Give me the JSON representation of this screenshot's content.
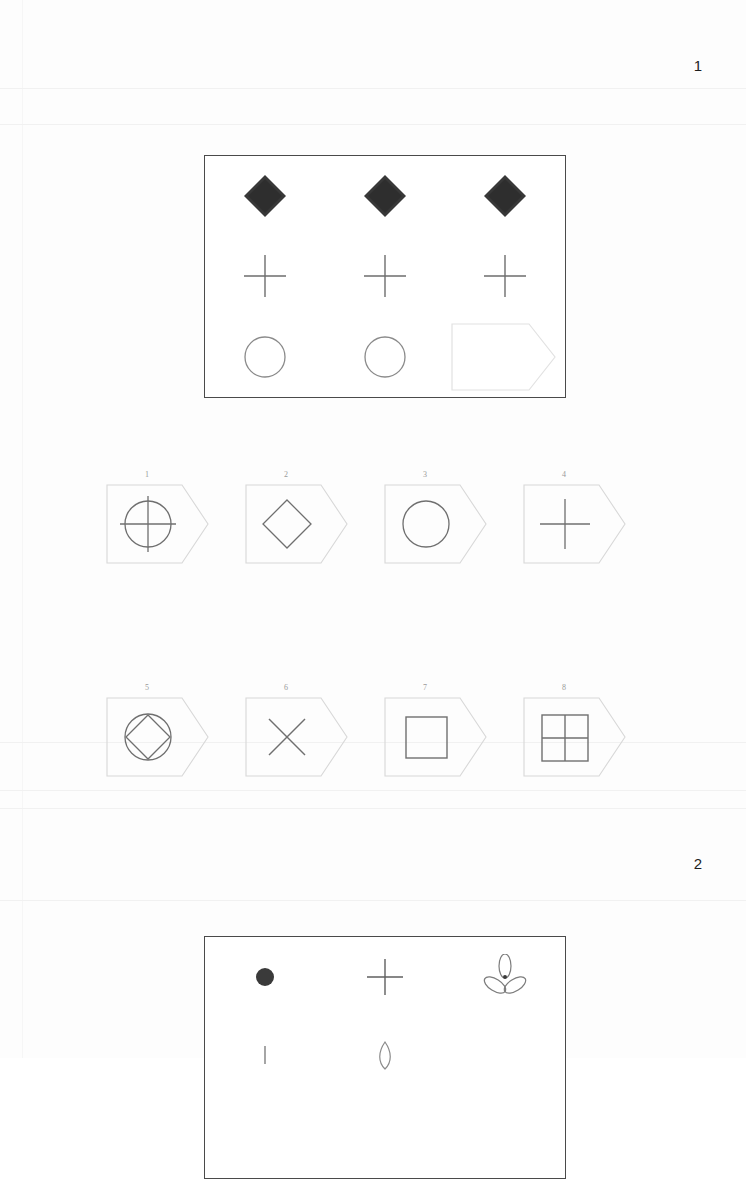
{
  "document": {
    "kind": "scanned-nonverbal-reasoning-test",
    "background_color": "#fdfdfd",
    "ink_color": "#4a4a4a"
  },
  "pages": [
    {
      "id": "page-1",
      "number": "1",
      "matrix": {
        "name": "matrix-problem-1",
        "rows": 3,
        "columns": 3,
        "cells": [
          {
            "row": 1,
            "col": 1,
            "shape": "filled-diamond",
            "state": "given",
            "fill": "#383838"
          },
          {
            "row": 1,
            "col": 2,
            "shape": "filled-diamond",
            "state": "given",
            "fill": "#383838"
          },
          {
            "row": 1,
            "col": 3,
            "shape": "filled-diamond",
            "state": "given",
            "fill": "#383838"
          },
          {
            "row": 2,
            "col": 1,
            "shape": "plus",
            "state": "given",
            "fill": "none"
          },
          {
            "row": 2,
            "col": 2,
            "shape": "plus",
            "state": "given",
            "fill": "none"
          },
          {
            "row": 2,
            "col": 3,
            "shape": "plus",
            "state": "given",
            "fill": "none"
          },
          {
            "row": 3,
            "col": 1,
            "shape": "circle-outline",
            "state": "given",
            "fill": "none"
          },
          {
            "row": 3,
            "col": 2,
            "shape": "circle-outline",
            "state": "given",
            "fill": "none"
          },
          {
            "row": 3,
            "col": 3,
            "shape": "tag-blank",
            "state": "missing",
            "fill": "none"
          }
        ]
      },
      "options": [
        {
          "number": "1",
          "shape": "circle-with-cross",
          "label": "1"
        },
        {
          "number": "2",
          "shape": "diamond-outline",
          "label": "2"
        },
        {
          "number": "3",
          "shape": "circle-outline",
          "label": "3"
        },
        {
          "number": "4",
          "shape": "plus",
          "label": "4"
        },
        {
          "number": "5",
          "shape": "circle-with-diamond",
          "label": "5"
        },
        {
          "number": "6",
          "shape": "x-cross",
          "label": "6"
        },
        {
          "number": "7",
          "shape": "square-outline",
          "label": "7"
        },
        {
          "number": "8",
          "shape": "square-quartered",
          "label": "8"
        }
      ]
    },
    {
      "id": "page-2",
      "number": "2",
      "matrix": {
        "name": "matrix-problem-2",
        "rows": 3,
        "columns": 3,
        "cells": [
          {
            "row": 1,
            "col": 1,
            "shape": "filled-dot",
            "state": "given",
            "fill": "#3a3a3a"
          },
          {
            "row": 1,
            "col": 2,
            "shape": "plus",
            "state": "given",
            "fill": "none"
          },
          {
            "row": 1,
            "col": 3,
            "shape": "trefoil",
            "state": "given",
            "fill": "none"
          },
          {
            "row": 2,
            "col": 1,
            "shape": "small-mark",
            "state": "given",
            "fill": "none"
          },
          {
            "row": 2,
            "col": 2,
            "shape": "petal",
            "state": "given",
            "fill": "none"
          },
          {
            "row": 2,
            "col": 3,
            "shape": "blank",
            "state": "given",
            "fill": "none"
          },
          {
            "row": 3,
            "col": 1,
            "shape": "blank",
            "state": "cropped",
            "fill": "none"
          },
          {
            "row": 3,
            "col": 2,
            "shape": "blank",
            "state": "cropped",
            "fill": "none"
          },
          {
            "row": 3,
            "col": 3,
            "shape": "blank",
            "state": "cropped",
            "fill": "none"
          }
        ]
      },
      "options": []
    }
  ]
}
